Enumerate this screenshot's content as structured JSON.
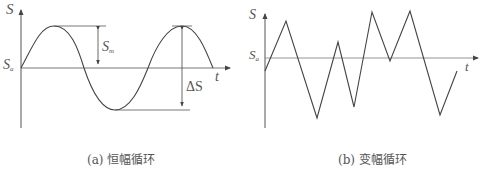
{
  "figure_a": {
    "caption": "(a) 恒幅循环",
    "y_axis_label": "S",
    "x_axis_label": "t",
    "origin_label_main": "S",
    "origin_label_sub": "a",
    "amplitude_label_main": "S",
    "amplitude_label_sub": "m",
    "range_label": "ΔS",
    "waveform": "sine"
  },
  "figure_b": {
    "caption": "(b) 变幅循环",
    "y_axis_label": "S",
    "x_axis_label": "t",
    "origin_label_main": "S",
    "origin_label_sub": "a",
    "waveform": "random triangular"
  },
  "colors": {
    "line": "#444444",
    "axis": "#555555",
    "text": "#555555"
  }
}
